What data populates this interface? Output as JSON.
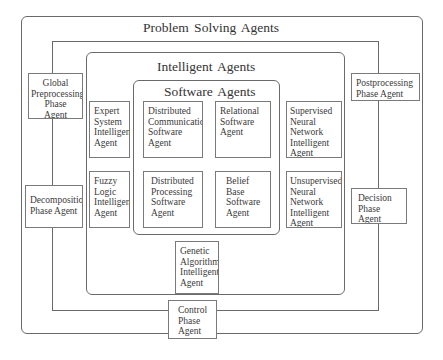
{
  "diagram": {
    "outer": {
      "title": "Problem Solving Agents"
    },
    "intelligent": {
      "title": "Intelligent Agents"
    },
    "software": {
      "title": "Software Agents"
    },
    "phase_agents": {
      "global_preprocessing": {
        "lines": [
          "Global",
          "Preprocessing",
          "Phase",
          "Agent"
        ]
      },
      "decomposition": {
        "lines": [
          "Decomposition",
          "Phase  Agent"
        ]
      },
      "postprocessing": {
        "lines": [
          "Postprocessing",
          "Phase Agent"
        ]
      },
      "decision": {
        "lines": [
          "Decision",
          "Phase",
          "Agent"
        ]
      },
      "control": {
        "lines": [
          "Control",
          "Phase",
          "Agent"
        ]
      }
    },
    "intelligent_agents": {
      "expert_system": {
        "lines": [
          "Expert",
          "System",
          "Intelligent",
          "Agent"
        ]
      },
      "fuzzy_logic": {
        "lines": [
          "Fuzzy",
          "Logic",
          "Intelligent",
          "Agent"
        ]
      },
      "supervised_nn": {
        "lines": [
          "Supervised",
          "Neural",
          "Network",
          "Intelligent",
          "Agent"
        ]
      },
      "unsupervised_nn": {
        "lines": [
          "Unsupervised",
          "Neural",
          "Network",
          "Intelligent",
          "Agent"
        ]
      },
      "genetic_algorithm": {
        "lines": [
          "Genetic",
          "Algorithm",
          "Intelligent",
          "Agent"
        ]
      }
    },
    "software_agents": {
      "distributed_communication": {
        "lines": [
          "Distributed",
          "Communication",
          "Software",
          "Agent"
        ]
      },
      "relational": {
        "lines": [
          "Relational",
          "Software",
          "Agent"
        ]
      },
      "distributed_processing": {
        "lines": [
          "Distributed",
          "Processing",
          "Software",
          "Agent"
        ]
      },
      "belief_base": {
        "lines": [
          "Belief",
          "Base",
          "Software",
          "Agent"
        ]
      }
    }
  }
}
